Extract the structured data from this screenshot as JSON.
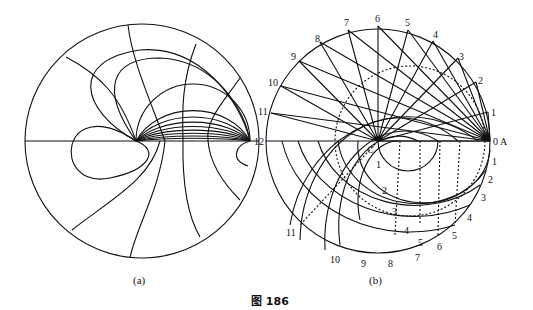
{
  "figure": {
    "caption": "图 186",
    "panel_a": {
      "label": "(a)"
    },
    "panel_b": {
      "label": "(b)",
      "point_c": "C",
      "point_a": "0 A",
      "upper_labels": [
        "1",
        "2",
        "3",
        "4",
        "5",
        "6",
        "7",
        "8",
        "9",
        "10",
        "11",
        "12"
      ],
      "lower_right_labels": [
        "1",
        "2",
        "3",
        "4",
        "5",
        "6",
        "7",
        "8",
        "9",
        "10",
        "11"
      ],
      "inner_labels": [
        "1",
        "2",
        "3",
        "4",
        "5"
      ]
    }
  }
}
